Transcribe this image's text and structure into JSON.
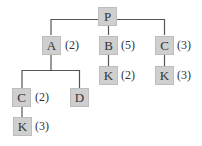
{
  "tree": {
    "line_color": "#555555",
    "node_color": "#cfcfcf",
    "nodes": [
      {
        "id": "P",
        "label": "P",
        "count": ""
      },
      {
        "id": "A",
        "label": "A",
        "count": "(2)"
      },
      {
        "id": "B",
        "label": "B",
        "count": "(5)"
      },
      {
        "id": "C1",
        "label": "C",
        "count": "(3)"
      },
      {
        "id": "K1",
        "label": "K",
        "count": "(2)"
      },
      {
        "id": "K2",
        "label": "K",
        "count": "(3)"
      },
      {
        "id": "C2",
        "label": "C",
        "count": "(2)"
      },
      {
        "id": "D",
        "label": "D",
        "count": ""
      },
      {
        "id": "K3",
        "label": "K",
        "count": "(3)"
      }
    ],
    "edges": [
      [
        "P",
        "A"
      ],
      [
        "P",
        "B"
      ],
      [
        "P",
        "C1"
      ],
      [
        "B",
        "K1"
      ],
      [
        "C1",
        "K2"
      ],
      [
        "A",
        "C2"
      ],
      [
        "A",
        "D"
      ],
      [
        "C2",
        "K3"
      ]
    ]
  }
}
